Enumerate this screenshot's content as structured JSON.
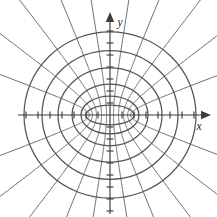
{
  "figure": {
    "background_color": "#ffffff",
    "curve_color": "#555555",
    "axis_color": "#3d3d3d",
    "width": 217,
    "height": 217
  },
  "axes": {
    "x_label": "x",
    "y_label": "y",
    "origin_x": 110,
    "origin_y": 115,
    "tick_spacing": 12,
    "x_ticks_per_side": 7,
    "y_ticks_per_side": 8,
    "tick_half_length": 3.5,
    "x_axis_start": 18,
    "x_axis_end": 205,
    "y_axis_start": 18,
    "y_axis_end": 214,
    "x_label_pos": {
      "x": 199,
      "y": 130
    },
    "y_label_pos": {
      "x": 120,
      "y": 26
    }
  },
  "chart_data": {
    "type": "line",
    "xlabel": "x",
    "ylabel": "y",
    "grid": false,
    "legend": "none",
    "focus_distance_px": 22,
    "foci": [
      {
        "x": -22,
        "y": 0
      },
      {
        "x": 22,
        "y": 0
      }
    ],
    "series": [
      {
        "name": "ellipse-1",
        "type": "ellipse",
        "semi_major_px": 24,
        "semi_minor_px": 9.8
      },
      {
        "name": "ellipse-2",
        "type": "ellipse",
        "semi_major_px": 29,
        "semi_minor_px": 18.9
      },
      {
        "name": "ellipse-3",
        "type": "ellipse",
        "semi_major_px": 38,
        "semi_minor_px": 30.9
      },
      {
        "name": "ellipse-4",
        "type": "ellipse",
        "semi_major_px": 52,
        "semi_minor_px": 47.1
      },
      {
        "name": "ellipse-5",
        "type": "ellipse",
        "semi_major_px": 68,
        "semi_minor_px": 64.3
      },
      {
        "name": "ellipse-6",
        "type": "ellipse",
        "semi_major_px": 86,
        "semi_minor_px": 83.1
      }
    ],
    "hyperbolas": [
      {
        "name": "hyperbola-1",
        "a_px": 3.5
      },
      {
        "name": "hyperbola-2",
        "a_px": 8.5
      },
      {
        "name": "hyperbola-3",
        "a_px": 13.5
      },
      {
        "name": "hyperbola-4",
        "a_px": 17.6
      },
      {
        "name": "hyperbola-5",
        "a_px": 20.6
      }
    ],
    "hyperbola_branch_count": 10,
    "ellipse_count": 6
  }
}
